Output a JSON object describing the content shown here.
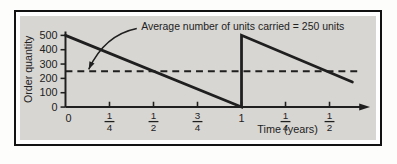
{
  "figure": {
    "kind": "inventory-sawtooth-figure"
  },
  "colors": {
    "panel": "#d8d6d2",
    "ink": "#1f1f1f",
    "frame": "#121212",
    "page": "#fdfdfc"
  },
  "chart_data": {
    "type": "line",
    "title": "",
    "xlabel": "Time (years)",
    "ylabel": "Order quantity",
    "xlim": [
      0,
      1.73
    ],
    "ylim": [
      0,
      500
    ],
    "grid": false,
    "legend": "none",
    "y_ticks": [
      {
        "v": 0,
        "label": "0"
      },
      {
        "v": 100,
        "label": "100"
      },
      {
        "v": 200,
        "label": "200"
      },
      {
        "v": 300,
        "label": "300"
      },
      {
        "v": 400,
        "label": "400"
      },
      {
        "v": 500,
        "label": "500"
      }
    ],
    "x_ticks": [
      {
        "v": 0,
        "label": "0"
      },
      {
        "v": 0.25,
        "num": "1",
        "den": "4"
      },
      {
        "v": 0.5,
        "num": "1",
        "den": "2"
      },
      {
        "v": 0.75,
        "num": "3",
        "den": "4"
      },
      {
        "v": 1,
        "label": "1"
      },
      {
        "v": 1.25,
        "num": "1",
        "den": "4"
      },
      {
        "v": 1.5,
        "num": "1",
        "den": "2"
      }
    ],
    "series": [
      {
        "name": "order-quantity-sawtooth",
        "style": "solid",
        "points": [
          [
            0,
            500
          ],
          [
            1,
            0
          ],
          [
            1,
            500
          ],
          [
            1.63,
            175
          ]
        ]
      },
      {
        "name": "average-inventory-line",
        "style": "dashed",
        "value": 250,
        "points": [
          [
            0,
            250
          ],
          [
            1.68,
            250
          ]
        ]
      }
    ],
    "annotation": {
      "text": "Average number of units carried = 250 units",
      "text_pos": [
        0.43,
        540
      ],
      "arrow_start": [
        0.405,
        548
      ],
      "arrow_tip": [
        0.132,
        263
      ]
    }
  }
}
